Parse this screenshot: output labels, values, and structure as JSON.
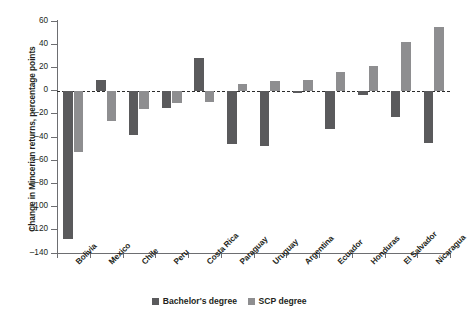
{
  "chart_data": {
    "type": "bar",
    "title": "",
    "xlabel": "",
    "ylabel": "Change in Mincerian returns, percentage points",
    "ylim": [
      -140,
      60
    ],
    "ytick_step": 20,
    "yticks": [
      60,
      40,
      20,
      0,
      -20,
      -40,
      -60,
      -80,
      -100,
      -120,
      -140
    ],
    "ytick_labels": [
      "60",
      "40",
      "20",
      "0",
      "–20",
      "–40",
      "–60",
      "–80",
      "–100",
      "–120",
      "–140"
    ],
    "grid": false,
    "zero_line": true,
    "legend_position": "bottom-center",
    "categories": [
      "Bolivia",
      "Mexico",
      "Chile",
      "Peru",
      "Costa Rica",
      "Paraguay",
      "Uruguay",
      "Argentina",
      "Ecuador",
      "Honduras",
      "El Salvador",
      "Nicaragua"
    ],
    "series": [
      {
        "name": "Bachelor's degree",
        "color": "#5a5a5c",
        "values": [
          -128,
          9,
          -38,
          -15,
          28,
          -46,
          -48,
          -2,
          -33,
          -4,
          -23,
          -45
        ]
      },
      {
        "name": "SCP degree",
        "color": "#8e8e90",
        "values": [
          -53,
          -26,
          -16,
          -11,
          -10,
          6,
          8,
          9,
          16,
          21,
          42,
          55
        ]
      }
    ]
  },
  "legend": {
    "items": [
      {
        "label": "Bachelor's degree",
        "color": "#5a5a5c"
      },
      {
        "label": "SCP degree",
        "color": "#8e8e90"
      }
    ]
  },
  "caption": {
    "text": ""
  }
}
